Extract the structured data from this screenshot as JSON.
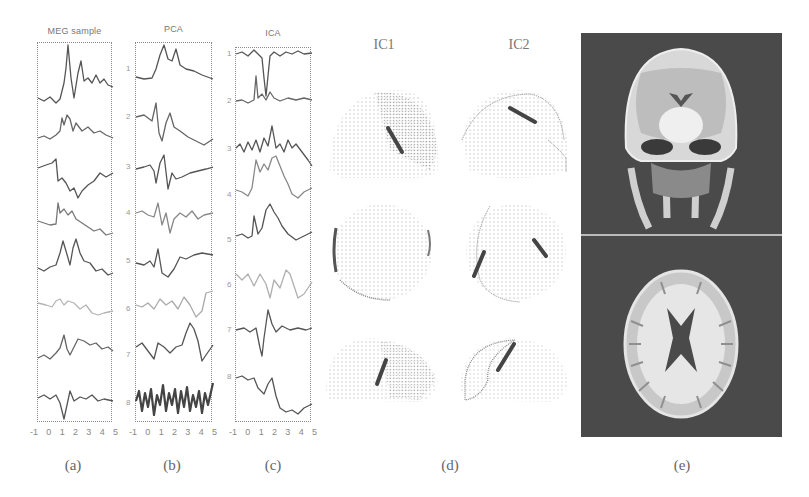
{
  "figure": {
    "panels": [
      {
        "id": "a",
        "caption": "(a)",
        "title": "MEG sample",
        "x_ticks": [
          "-1",
          "0",
          "1",
          "2",
          "3",
          "4",
          "5"
        ],
        "trace_count": 8,
        "trace_labels": []
      },
      {
        "id": "b",
        "caption": "(b)",
        "title": "PCA",
        "x_ticks": [
          "-1",
          "0",
          "1",
          "2",
          "3",
          "4",
          "5"
        ],
        "trace_count": 8,
        "trace_labels": [
          "1",
          "2",
          "3",
          "4",
          "5",
          "6",
          "7",
          "8"
        ]
      },
      {
        "id": "c",
        "caption": "(c)",
        "title": "ICA",
        "x_ticks": [
          "-1",
          "0",
          "1",
          "2",
          "3",
          "4",
          "5"
        ],
        "trace_count": 8,
        "trace_labels": [
          "1",
          "2",
          "3",
          "4",
          "5",
          "6",
          "7",
          "8"
        ]
      },
      {
        "id": "d",
        "caption": "(d)",
        "columns": [
          "IC1",
          "IC2"
        ],
        "rows": 3,
        "description": "Field maps of independent components on head surface (three views each)"
      },
      {
        "id": "e",
        "caption": "(e)",
        "images": [
          "coronal MRI slice",
          "axial MRI slice"
        ]
      }
    ]
  },
  "colors": {
    "background": "#ffffff",
    "trace_dark": "#555555",
    "trace_light": "#b0b0b0",
    "frame": "#8a8a8a",
    "mri_bg": "#4a4a4a"
  }
}
